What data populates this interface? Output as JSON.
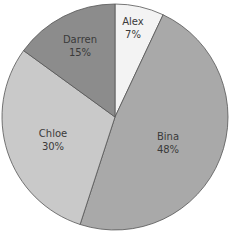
{
  "chart_data": {
    "type": "pie",
    "title": "",
    "categories": [
      "Alex",
      "Bina",
      "Chloe",
      "Darren"
    ],
    "values": [
      7,
      48,
      30,
      15
    ],
    "labels": [
      "7%",
      "48%",
      "30%",
      "15%"
    ],
    "colors": [
      "#f3f3f3",
      "#a9a9a9",
      "#c9c9c9",
      "#8c8c8c"
    ],
    "start_angle": "12 o'clock, clockwise",
    "legend": "none (labels inside slices)"
  },
  "slices": [
    {
      "name": "Alex",
      "pct": "7%"
    },
    {
      "name": "Bina",
      "pct": "48%"
    },
    {
      "name": "Chloe",
      "pct": "30%"
    },
    {
      "name": "Darren",
      "pct": "15%"
    }
  ]
}
